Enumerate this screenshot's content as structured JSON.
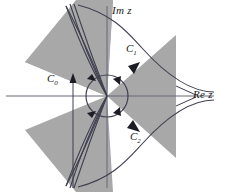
{
  "figure": {
    "title_alt": "Complex z-plane with steepest descent contours and Stokes sectors",
    "width": 229,
    "height": 192,
    "background_color": "#ffffff",
    "sector_fill_color": "#a8a8a8",
    "curve_color": "#3a3a4a",
    "axis_color": "#555566"
  },
  "axes": {
    "imaginary_label": "Im z",
    "real_label": "Re z",
    "origin": {
      "x": 107,
      "y": 96
    }
  },
  "contours": {
    "c0": {
      "label": "C",
      "subscript": "0"
    },
    "c1": {
      "label": "C",
      "subscript": "1"
    },
    "c2": {
      "label": "C",
      "subscript": "2"
    }
  },
  "circle": {
    "center_x": 107,
    "center_y": 96,
    "radius": 21
  },
  "sectors": [
    {
      "name": "upper-left-sector"
    },
    {
      "name": "right-sector"
    },
    {
      "name": "lower-left-sector"
    }
  ]
}
